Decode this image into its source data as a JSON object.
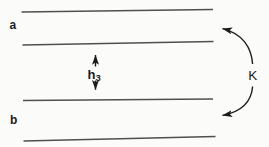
{
  "diagram": {
    "labels": {
      "region_top": "a",
      "region_bottom": "b",
      "spacing_base": "h",
      "spacing_subscript": "3",
      "coupling": "K"
    },
    "icons": {
      "spacing_arrow": "double-headed-vertical-arrow",
      "coupling_arrow": "curved-double-headed-arrow"
    },
    "line_count": 4
  },
  "colors": {
    "bg": "#fbfbf9",
    "line": "#4f4f4f",
    "ink": "#1c1c1c"
  }
}
